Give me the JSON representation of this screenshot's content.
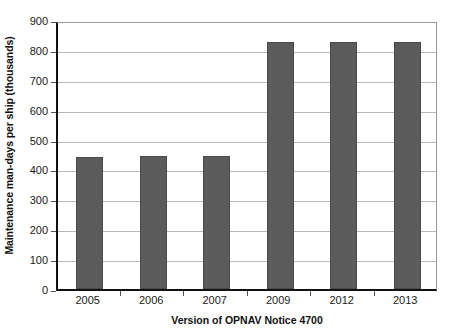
{
  "chart_data": {
    "type": "bar",
    "title": "",
    "subtitle": "",
    "xlabel": "Version of OPNAV Notice 4700",
    "ylabel": "Maintenance man-days per ship (thousands)",
    "categories": [
      "2005",
      "2006",
      "2007",
      "2009",
      "2012",
      "2013"
    ],
    "values": [
      443,
      445,
      444,
      826,
      827,
      827
    ],
    "series": [
      {
        "name": "Maintenance man-days per ship",
        "values": [
          443,
          445,
          444,
          826,
          827,
          827
        ]
      }
    ],
    "ylim": [
      0,
      900
    ],
    "ytick_labels": [
      "0",
      "100",
      "200",
      "300",
      "400",
      "500",
      "600",
      "700",
      "800",
      "900"
    ],
    "ytick_values": [
      0,
      100,
      200,
      300,
      400,
      500,
      600,
      700,
      800,
      900
    ],
    "grid": true,
    "grid_axis": "y",
    "legend": false,
    "legend_position": "none",
    "bar_color": "#5b5b5b",
    "grid_color": "#b8b8b8",
    "axis_color": "#111111",
    "background_color": "#ffffff"
  }
}
